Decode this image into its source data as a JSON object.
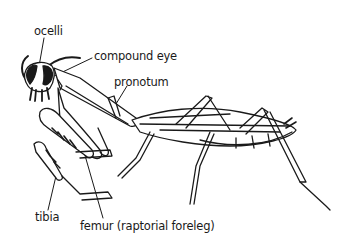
{
  "diagram": {
    "labels": {
      "ocelli": "ocelli",
      "compound_eye": "compound eye",
      "pronotum": "pronotum",
      "tibia": "tibia",
      "femur": "femur (raptorial foreleg)"
    },
    "colors": {
      "line": "#1a1a1a",
      "background": "#ffffff"
    }
  }
}
